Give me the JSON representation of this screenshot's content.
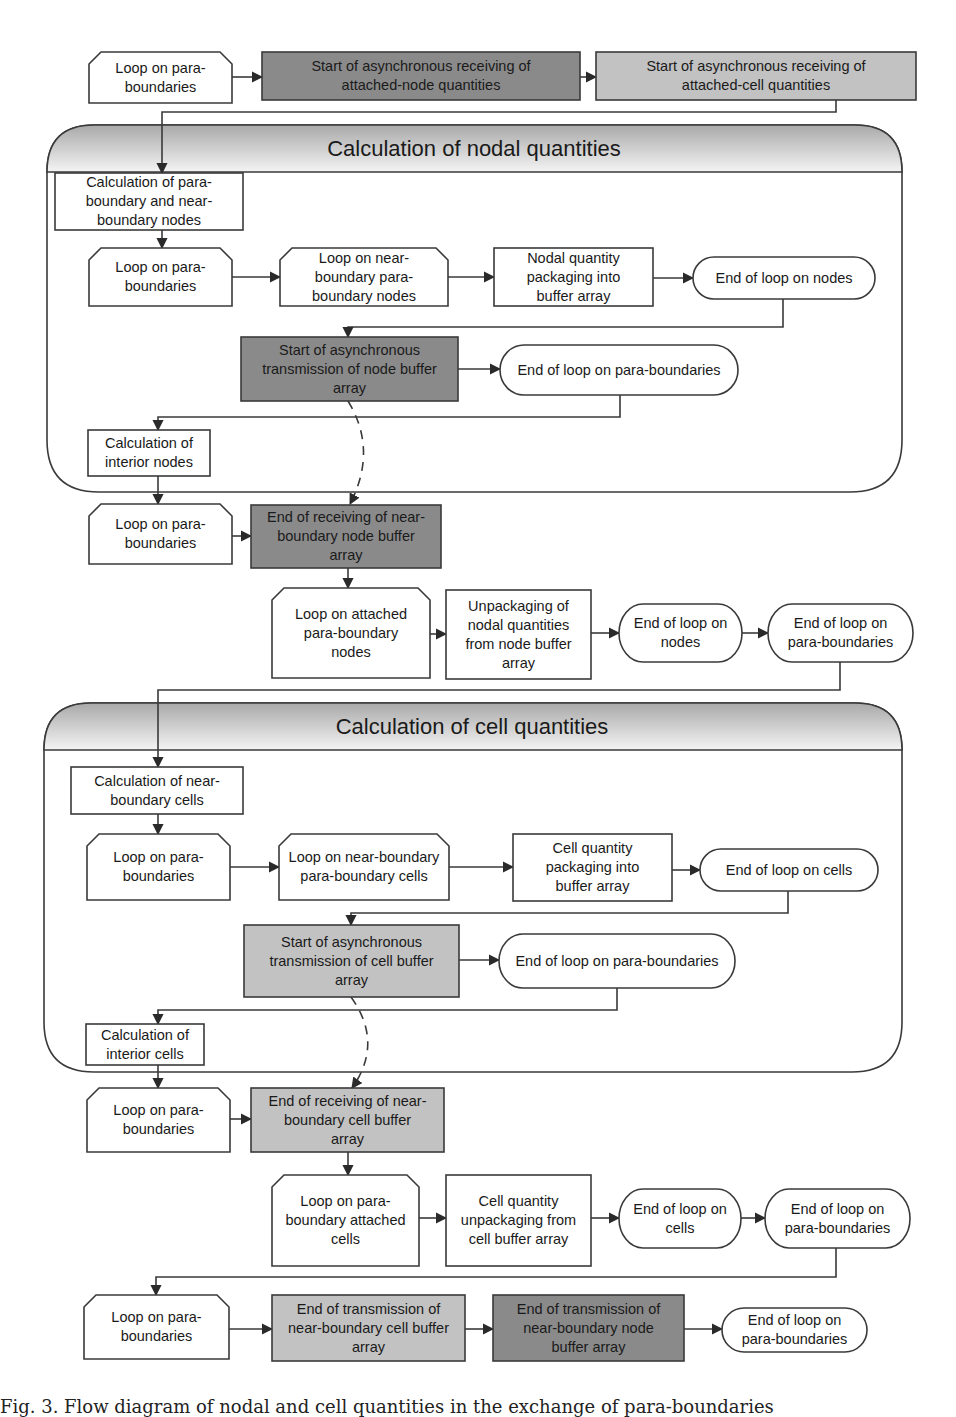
{
  "colors": {
    "white": "#ffffff",
    "dark": "#8a8a8a",
    "light": "#c2c2c2",
    "stroke": "#3a3a3a",
    "header_top": "#a9a9a9",
    "header_bottom": "#f2f2f2"
  },
  "containers": [
    {
      "id": "nodal",
      "title": "Calculation of nodal quantities"
    },
    {
      "id": "cell",
      "title": "Calculation of cell quantities"
    }
  ],
  "nodes": [
    {
      "id": "n1",
      "shape": "loop",
      "fill": "white",
      "lines": [
        "Loop on para-",
        "boundaries"
      ]
    },
    {
      "id": "n2",
      "shape": "rect",
      "fill": "dark",
      "lines": [
        "Start of asynchronous receiving of",
        "attached-node quantities"
      ]
    },
    {
      "id": "n3",
      "shape": "rect",
      "fill": "light",
      "lines": [
        "Start of asynchronous receiving of",
        "attached-cell quantities"
      ]
    },
    {
      "id": "n4",
      "shape": "rect",
      "fill": "white",
      "lines": [
        "Calculation of para-",
        "boundary and near-",
        "boundary nodes"
      ]
    },
    {
      "id": "n5",
      "shape": "loop",
      "fill": "white",
      "lines": [
        "Loop on para-",
        "boundaries"
      ]
    },
    {
      "id": "n6",
      "shape": "loop",
      "fill": "white",
      "lines": [
        "Loop on near-",
        "boundary para-",
        "boundary nodes"
      ]
    },
    {
      "id": "n7",
      "shape": "rect",
      "fill": "white",
      "lines": [
        "Nodal quantity",
        "packaging into",
        "buffer array"
      ]
    },
    {
      "id": "n8",
      "shape": "pill",
      "fill": "white",
      "lines": [
        "End of loop on nodes"
      ]
    },
    {
      "id": "n9",
      "shape": "rect",
      "fill": "dark",
      "lines": [
        "Start of asynchronous",
        "transmission of node buffer",
        "array"
      ]
    },
    {
      "id": "n10",
      "shape": "pill",
      "fill": "white",
      "lines": [
        "End of loop on para-boundaries"
      ]
    },
    {
      "id": "n11",
      "shape": "rect",
      "fill": "white",
      "lines": [
        "Calculation of",
        "interior nodes"
      ]
    },
    {
      "id": "n12",
      "shape": "loop",
      "fill": "white",
      "lines": [
        "Loop on para-",
        "boundaries"
      ]
    },
    {
      "id": "n13",
      "shape": "rect",
      "fill": "dark",
      "lines": [
        "End of receiving of near-",
        "boundary node buffer",
        "array"
      ]
    },
    {
      "id": "n14",
      "shape": "loop",
      "fill": "white",
      "lines": [
        "Loop on attached",
        "para-boundary",
        "nodes"
      ]
    },
    {
      "id": "n15",
      "shape": "rect",
      "fill": "white",
      "lines": [
        "Unpackaging of",
        "nodal quantities",
        "from node buffer",
        "array"
      ]
    },
    {
      "id": "n16",
      "shape": "pill",
      "fill": "white",
      "lines": [
        "End of loop on",
        "nodes"
      ]
    },
    {
      "id": "n17",
      "shape": "pill",
      "fill": "white",
      "lines": [
        "End of loop on",
        "para-boundaries"
      ]
    },
    {
      "id": "n18",
      "shape": "rect",
      "fill": "white",
      "lines": [
        "Calculation of near-",
        "boundary cells"
      ]
    },
    {
      "id": "n19",
      "shape": "loop",
      "fill": "white",
      "lines": [
        "Loop on para-",
        "boundaries"
      ]
    },
    {
      "id": "n20",
      "shape": "loop",
      "fill": "white",
      "lines": [
        "Loop on near-boundary",
        "para-boundary cells"
      ]
    },
    {
      "id": "n21",
      "shape": "rect",
      "fill": "white",
      "lines": [
        "Cell quantity",
        "packaging into",
        "buffer array"
      ]
    },
    {
      "id": "n22",
      "shape": "pill",
      "fill": "white",
      "lines": [
        "End of loop on cells"
      ]
    },
    {
      "id": "n23",
      "shape": "rect",
      "fill": "light",
      "lines": [
        "Start of asynchronous",
        "transmission of cell buffer",
        "array"
      ]
    },
    {
      "id": "n24",
      "shape": "pill",
      "fill": "white",
      "lines": [
        "End of loop on para-boundaries"
      ]
    },
    {
      "id": "n25",
      "shape": "rect",
      "fill": "white",
      "lines": [
        "Calculation of",
        "interior cells"
      ]
    },
    {
      "id": "n26",
      "shape": "loop",
      "fill": "white",
      "lines": [
        "Loop on para-",
        "boundaries"
      ]
    },
    {
      "id": "n27",
      "shape": "rect",
      "fill": "light",
      "lines": [
        "End of receiving of near-",
        "boundary cell buffer",
        "array"
      ]
    },
    {
      "id": "n28",
      "shape": "loop",
      "fill": "white",
      "lines": [
        "Loop on para-",
        "boundary attached",
        "cells"
      ]
    },
    {
      "id": "n29",
      "shape": "rect",
      "fill": "white",
      "lines": [
        "Cell quantity",
        "unpackaging from",
        "cell buffer array"
      ]
    },
    {
      "id": "n30",
      "shape": "pill",
      "fill": "white",
      "lines": [
        "End of loop on",
        "cells"
      ]
    },
    {
      "id": "n31",
      "shape": "pill",
      "fill": "white",
      "lines": [
        "End of loop on",
        "para-boundaries"
      ]
    },
    {
      "id": "n32",
      "shape": "loop",
      "fill": "white",
      "lines": [
        "Loop on para-",
        "boundaries"
      ]
    },
    {
      "id": "n33",
      "shape": "rect",
      "fill": "light",
      "lines": [
        "End of transmission of",
        "near-boundary cell buffer",
        "array"
      ]
    },
    {
      "id": "n34",
      "shape": "rect",
      "fill": "dark",
      "lines": [
        "End of transmission of",
        "near-boundary node",
        "buffer array"
      ]
    },
    {
      "id": "n35",
      "shape": "pill",
      "fill": "white",
      "lines": [
        "End of loop on",
        "para-boundaries"
      ]
    }
  ],
  "edges": [
    {
      "from": "n1",
      "to": "n2",
      "style": "solid"
    },
    {
      "from": "n2",
      "to": "n3",
      "style": "solid"
    },
    {
      "from": "n3",
      "to": "n4",
      "style": "solid"
    },
    {
      "from": "n4",
      "to": "n5",
      "style": "solid"
    },
    {
      "from": "n5",
      "to": "n6",
      "style": "solid"
    },
    {
      "from": "n6",
      "to": "n7",
      "style": "solid"
    },
    {
      "from": "n7",
      "to": "n8",
      "style": "solid"
    },
    {
      "from": "n8",
      "to": "n9",
      "style": "solid"
    },
    {
      "from": "n9",
      "to": "n10",
      "style": "solid"
    },
    {
      "from": "n10",
      "to": "n11",
      "style": "solid"
    },
    {
      "from": "n11",
      "to": "n12",
      "style": "solid"
    },
    {
      "from": "n9",
      "to": "n13",
      "style": "dashed"
    },
    {
      "from": "n12",
      "to": "n13",
      "style": "solid"
    },
    {
      "from": "n13",
      "to": "n14",
      "style": "solid"
    },
    {
      "from": "n14",
      "to": "n15",
      "style": "solid"
    },
    {
      "from": "n15",
      "to": "n16",
      "style": "solid"
    },
    {
      "from": "n16",
      "to": "n17",
      "style": "solid"
    },
    {
      "from": "n17",
      "to": "n18",
      "style": "solid"
    },
    {
      "from": "n18",
      "to": "n19",
      "style": "solid"
    },
    {
      "from": "n19",
      "to": "n20",
      "style": "solid"
    },
    {
      "from": "n20",
      "to": "n21",
      "style": "solid"
    },
    {
      "from": "n21",
      "to": "n22",
      "style": "solid"
    },
    {
      "from": "n22",
      "to": "n23",
      "style": "solid"
    },
    {
      "from": "n23",
      "to": "n24",
      "style": "solid"
    },
    {
      "from": "n24",
      "to": "n25",
      "style": "solid"
    },
    {
      "from": "n25",
      "to": "n26",
      "style": "solid"
    },
    {
      "from": "n23",
      "to": "n27",
      "style": "dashed"
    },
    {
      "from": "n26",
      "to": "n27",
      "style": "solid"
    },
    {
      "from": "n27",
      "to": "n28",
      "style": "solid"
    },
    {
      "from": "n28",
      "to": "n29",
      "style": "solid"
    },
    {
      "from": "n29",
      "to": "n30",
      "style": "solid"
    },
    {
      "from": "n30",
      "to": "n31",
      "style": "solid"
    },
    {
      "from": "n31",
      "to": "n32",
      "style": "solid"
    },
    {
      "from": "n32",
      "to": "n33",
      "style": "solid"
    },
    {
      "from": "n33",
      "to": "n34",
      "style": "solid"
    },
    {
      "from": "n34",
      "to": "n35",
      "style": "solid"
    }
  ],
  "caption": "Fig. 3. Flow diagram of nodal and cell quantities in the exchange of para-boundaries"
}
